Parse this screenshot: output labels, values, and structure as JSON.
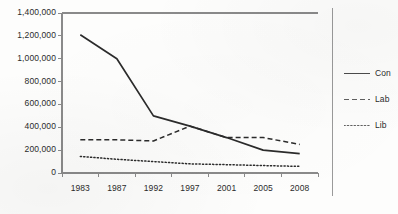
{
  "chart_data": {
    "type": "line",
    "title": "",
    "subtitle": "",
    "xlabel": "",
    "ylabel": "",
    "categories": [
      "1983",
      "1987",
      "1992",
      "1997",
      "2001",
      "2005",
      "2008"
    ],
    "series": [
      {
        "name": "Con",
        "style": "solid",
        "color": "#2b2b2b",
        "values": [
          1210000,
          1000000,
          500000,
          410000,
          310000,
          200000,
          170000
        ]
      },
      {
        "name": "Lab",
        "style": "dashed",
        "color": "#2b2b2b",
        "values": [
          290000,
          290000,
          280000,
          410000,
          310000,
          310000,
          250000
        ]
      },
      {
        "name": "Lib",
        "style": "dotted",
        "color": "#2b2b2b",
        "values": [
          145000,
          120000,
          100000,
          80000,
          73000,
          65000,
          58000
        ]
      }
    ],
    "ylim": [
      0,
      1400000
    ],
    "ytick_values": [
      0,
      200000,
      400000,
      600000,
      800000,
      1000000,
      1200000,
      1400000
    ],
    "ytick_labels": [
      "0",
      "200,000",
      "400,000",
      "600,000",
      "800,000",
      "1,000,000",
      "1,200,000",
      "1,400,000"
    ],
    "grid": false,
    "legend_position": "right",
    "legend_entries": [
      {
        "label": "Con",
        "style": "solid"
      },
      {
        "label": "Lab",
        "style": "dashed"
      },
      {
        "label": "Lib",
        "style": "dotted"
      }
    ],
    "axis_color": "#8a8a8a",
    "text_color": "#2b2b2b",
    "background_color": "#fdfdfc"
  }
}
